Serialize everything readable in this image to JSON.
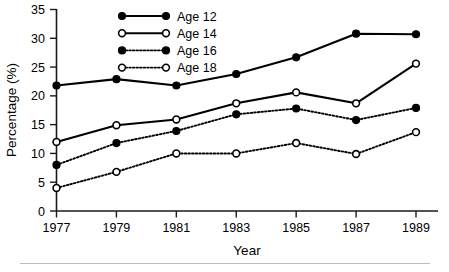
{
  "chart_data": {
    "type": "line",
    "title": "",
    "subtitle": "",
    "xlabel": "Year",
    "ylabel": "Percentage (%)",
    "x": [
      1977,
      1979,
      1981,
      1983,
      1985,
      1987,
      1989
    ],
    "xtick_labels": [
      "1977",
      "1979",
      "1981",
      "1983",
      "1985",
      "1987",
      "1989"
    ],
    "ytick_labels": [
      "0",
      "5",
      "10",
      "15",
      "20",
      "25",
      "30",
      "35"
    ],
    "ytick_values": [
      0,
      5,
      10,
      15,
      20,
      25,
      30,
      35
    ],
    "xlim": [
      1977,
      1989
    ],
    "ylim": [
      0,
      35
    ],
    "grid": false,
    "legend_position": "top-center-inside",
    "series": [
      {
        "name": "Age 12",
        "marker": "filled-circle",
        "line": "solid",
        "color": "#000000",
        "values": [
          21.8,
          22.9,
          21.8,
          23.8,
          26.7,
          30.8,
          30.7
        ]
      },
      {
        "name": "Age 14",
        "marker": "open-circle",
        "line": "solid",
        "color": "#000000",
        "values": [
          12.0,
          14.9,
          15.9,
          18.7,
          20.6,
          18.7,
          25.6
        ]
      },
      {
        "name": "Age 16",
        "marker": "filled-circle",
        "line": "dotted",
        "color": "#000000",
        "values": [
          8.0,
          11.8,
          13.9,
          16.8,
          17.8,
          15.8,
          17.9
        ]
      },
      {
        "name": "Age 18",
        "marker": "open-circle",
        "line": "dotted",
        "color": "#000000",
        "values": [
          4.0,
          6.8,
          10.0,
          10.0,
          11.8,
          9.9,
          13.7
        ]
      }
    ]
  },
  "legend": {
    "entries": [
      {
        "label": "Age 12"
      },
      {
        "label": "Age 14"
      },
      {
        "label": "Age 16"
      },
      {
        "label": "Age 18"
      }
    ]
  },
  "footer": {
    "rule_color": "#bdbdbd"
  }
}
